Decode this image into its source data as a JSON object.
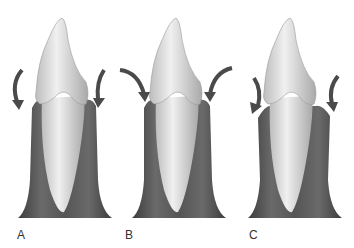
{
  "figure": {
    "panels": [
      {
        "id": "A",
        "label": "A",
        "arrow_style": "short, curving downward close to tooth crown"
      },
      {
        "id": "B",
        "label": "B",
        "arrow_style": "longer, curving inward from outside"
      },
      {
        "id": "C",
        "label": "C",
        "arrow_style": "short, curving downward, gingiva angled toward tooth"
      }
    ],
    "colors": {
      "tooth": "#e8e8e8",
      "tooth_shade": "#a9a9a9",
      "gingiva": "#5a5a5a",
      "gingiva_dark": "#3c3c3c",
      "arrow": "#4a4a4a",
      "label": "#333333"
    }
  }
}
